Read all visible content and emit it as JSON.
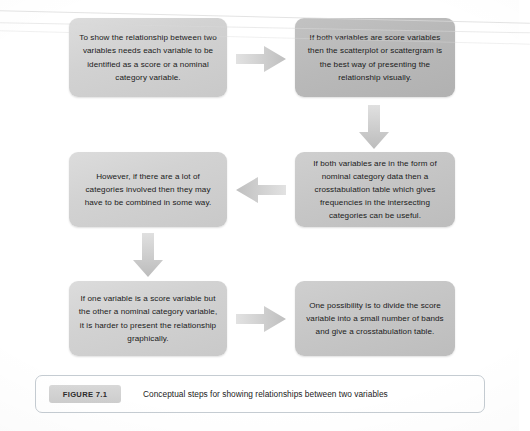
{
  "figure": {
    "number_label": "FIGURE 7.1",
    "caption": "Conceptual steps for showing relationships between two variables",
    "background_color": "#ffffff",
    "box_fill_light": "#d2d2d2",
    "box_fill_mid": "#c6c6c6",
    "box_fill_dark": "#b9b9b9",
    "arrow_color": "#c9c9c9",
    "text_color": "#1a1a1a",
    "caption_border_color": "#c5ccd2"
  },
  "boxes": [
    {
      "id": "box-1",
      "text": "To show the relationship between two variables needs each variable to be identified as a score or a nominal category variable.",
      "tone": "light"
    },
    {
      "id": "box-2",
      "text": "If both variables are score variables then the scatterplot or scattergram is the best way of presenting the relationship visually.",
      "tone": "dark"
    },
    {
      "id": "box-3",
      "text": "However, if there are a lot of categories involved then they may have to be combined in some way.",
      "tone": "light"
    },
    {
      "id": "box-4",
      "text": "If both variables are in the form of nominal category data then a crosstabulation table which gives frequencies in the intersecting categories can be useful.",
      "tone": "mid"
    },
    {
      "id": "box-5",
      "text": "If one variable is a score variable but the other a nominal category variable, it is harder to present the relationship graphically.",
      "tone": "light"
    },
    {
      "id": "box-6",
      "text": "One possibility is to divide the score variable into a small number of bands and give a crosstabulation table.",
      "tone": "mid"
    }
  ],
  "arrows": [
    {
      "id": "arrow-1",
      "direction": "right",
      "from": "box-1",
      "to": "box-2"
    },
    {
      "id": "arrow-2",
      "direction": "down",
      "from": "box-2",
      "to": "box-4"
    },
    {
      "id": "arrow-3",
      "direction": "left",
      "from": "box-4",
      "to": "box-3"
    },
    {
      "id": "arrow-4",
      "direction": "down",
      "from": "box-3",
      "to": "box-5"
    },
    {
      "id": "arrow-5",
      "direction": "right",
      "from": "box-5",
      "to": "box-6"
    }
  ]
}
